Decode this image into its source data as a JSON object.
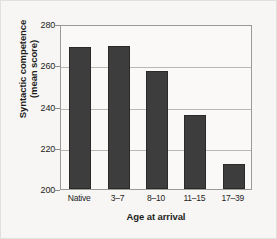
{
  "chart_data": {
    "type": "bar",
    "title": "",
    "subtitle": "",
    "xlabel": "Age at arrival",
    "ylabel_line1": "Syntactic competence",
    "ylabel_line2": "(mean score)",
    "categories": [
      "Native",
      "3–7",
      "8–10",
      "11–15",
      "17–39"
    ],
    "values": [
      269,
      269.5,
      257,
      236,
      212
    ],
    "ylim": [
      200,
      280
    ],
    "yticks": [
      280,
      260,
      240,
      220,
      200
    ],
    "ytick_labels": [
      "280",
      "260",
      "240",
      "220",
      "200"
    ],
    "grid": true,
    "grid_axis": "y",
    "legend": false,
    "bar_color": "#3d3d3d",
    "plot_background": "#faf9f7",
    "figure_background": "#f7f6f4",
    "grid_color": "#b9b9b4",
    "axis_color": "#9a9a96",
    "text_color": "#1d1d1b"
  }
}
